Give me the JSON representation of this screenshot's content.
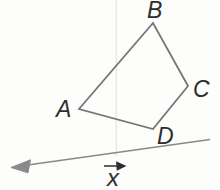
{
  "figure": {
    "type": "geometry-diagram",
    "vertex_labels": {
      "a": "A",
      "b": "B",
      "c": "C",
      "d": "D"
    },
    "vector_label": "x",
    "geometry": {
      "polygon_points": "79,109 153,23 188,86 153,129",
      "vector_line_path": "M210,139.5 L24,165.6",
      "vector_arrowhead_path": "M11,167.5 L30.5,159.8 L28,172.8 Z",
      "vector_label_arrow_path": "M104,166 L119,166 M124.5,166 L117,162.6 L117.5,169.4 Z",
      "guide_line_path": "M116.3,0 L116.3,156"
    },
    "colors": {
      "shape_stroke": "#757575",
      "vector_stroke": "#8a8a8a",
      "label_text": "#2e2e2e",
      "guide_line": "#e6e8e3",
      "background": "#fdfdfc"
    }
  }
}
